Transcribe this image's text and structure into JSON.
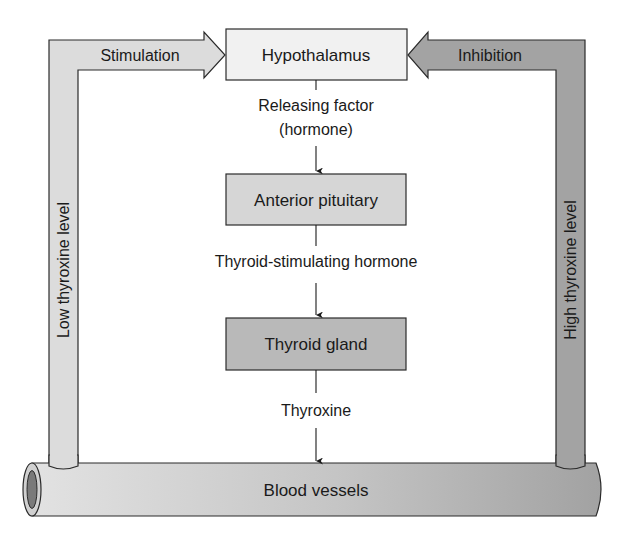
{
  "diagram": {
    "nodes": {
      "hypothalamus": {
        "label": "Hypothalamus",
        "fill": "#f1f1f1"
      },
      "anterior_pituitary": {
        "label": "Anterior pituitary",
        "fill": "#d6d6d6"
      },
      "thyroid_gland": {
        "label": "Thyroid gland",
        "fill": "#b9b9b9"
      },
      "blood_vessels": {
        "label": "Blood vessels",
        "fill_light": "#dedede",
        "fill_dark": "#a6a6a6"
      }
    },
    "edges": {
      "releasing_factor": {
        "line1": "Releasing factor",
        "line2": "(hormone)"
      },
      "tsh": {
        "label": "Thyroid-stimulating hormone"
      },
      "thyroxine": {
        "label": "Thyroxine"
      }
    },
    "feedback": {
      "stimulation": {
        "label": "Stimulation",
        "pipe_label": "Low thyroxine level",
        "fill": "#dcdcdc"
      },
      "inhibition": {
        "label": "Inhibition",
        "pipe_label": "High thyroxine level",
        "fill": "#a3a3a3"
      }
    }
  }
}
